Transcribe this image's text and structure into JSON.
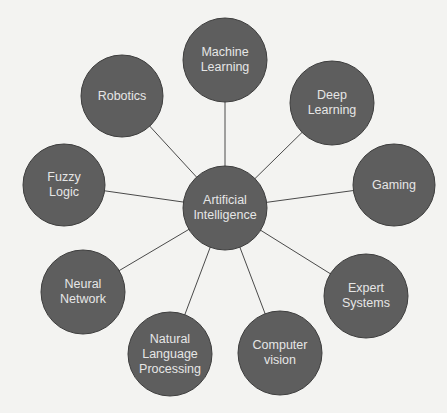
{
  "diagram": {
    "title": "Artificial Intelligence",
    "style": {
      "background": "#f3f3f1",
      "node_fill": "#5e5e5e",
      "node_stroke": "#3d3d3d",
      "edge_color": "#4a4a4a",
      "label_color": "#e6e6e6"
    },
    "center_node": {
      "id": "ai",
      "label": "Artificial\nIntelligence",
      "cx": 225,
      "cy": 208,
      "r": 42
    },
    "nodes": [
      {
        "id": "machine-learning",
        "label": "Machine\nLearning",
        "cx": 225,
        "cy": 60,
        "r": 42
      },
      {
        "id": "deep-learning",
        "label": "Deep\nLearning",
        "cx": 332,
        "cy": 103,
        "r": 42
      },
      {
        "id": "gaming",
        "label": "Gaming",
        "cx": 394,
        "cy": 185,
        "r": 41
      },
      {
        "id": "expert-systems",
        "label": "Expert\nSystems",
        "cx": 366,
        "cy": 296,
        "r": 42
      },
      {
        "id": "computer-vision",
        "label": "Computer\nvision",
        "cx": 280,
        "cy": 353,
        "r": 42
      },
      {
        "id": "natural-language-processing",
        "label": "Natural\nLanguage\nProcessing",
        "cx": 170,
        "cy": 354,
        "r": 42
      },
      {
        "id": "neural-network",
        "label": "Neural\nNetwork",
        "cx": 83,
        "cy": 292,
        "r": 42
      },
      {
        "id": "fuzzy-logic",
        "label": "Fuzzy\nLogic",
        "cx": 64,
        "cy": 185,
        "r": 41
      },
      {
        "id": "robotics",
        "label": "Robotics",
        "cx": 122,
        "cy": 96,
        "r": 41
      }
    ],
    "edges": [
      {
        "from": "ai",
        "to": "machine-learning"
      },
      {
        "from": "ai",
        "to": "deep-learning"
      },
      {
        "from": "ai",
        "to": "gaming"
      },
      {
        "from": "ai",
        "to": "expert-systems"
      },
      {
        "from": "ai",
        "to": "computer-vision"
      },
      {
        "from": "ai",
        "to": "natural-language-processing"
      },
      {
        "from": "ai",
        "to": "neural-network"
      },
      {
        "from": "ai",
        "to": "fuzzy-logic"
      },
      {
        "from": "ai",
        "to": "robotics"
      }
    ]
  }
}
